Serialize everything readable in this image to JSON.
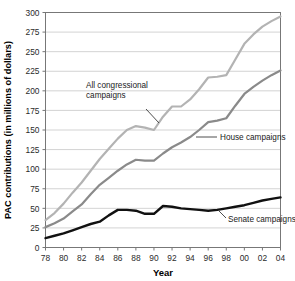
{
  "chart_data": {
    "type": "line",
    "title": "",
    "xlabel": "Year",
    "ylabel": "PAC contributions (in millions of dollars)",
    "xlim": [
      78,
      104
    ],
    "ylim": [
      0,
      300
    ],
    "ytick_step": 25,
    "grid": true,
    "legend_position": "inline-annotations",
    "categories": [
      "78",
      "80",
      "82",
      "84",
      "86",
      "88",
      "90",
      "92",
      "94",
      "96",
      "98",
      "00",
      "02",
      "04"
    ],
    "x": [
      1978,
      1980,
      1982,
      1984,
      1986,
      1988,
      1990,
      1992,
      1994,
      1996,
      1998,
      2000,
      2002,
      2004
    ],
    "xtick_labels": [
      "78",
      "80",
      "82",
      "84",
      "86",
      "88",
      "90",
      "92",
      "94",
      "96",
      "98",
      "00",
      "02",
      "04"
    ],
    "ytick_labels": [
      "0",
      "25",
      "50",
      "75",
      "100",
      "125",
      "150",
      "175",
      "200",
      "225",
      "250",
      "275",
      "300"
    ],
    "ytick_values": [
      0,
      25,
      50,
      75,
      100,
      125,
      150,
      175,
      200,
      225,
      250,
      275,
      300
    ],
    "series": [
      {
        "name": "All congressional campaigns",
        "color": "#b3b3b3",
        "label_position": "upper-left",
        "values": [
          35,
          56,
          83,
          113,
          139,
          155,
          150,
          180,
          189,
          217,
          220,
          260,
          282,
          295
        ],
        "points": [
          {
            "x": 1978,
            "y": 35
          },
          {
            "x": 1979,
            "y": 44
          },
          {
            "x": 1980,
            "y": 56
          },
          {
            "x": 1981,
            "y": 70
          },
          {
            "x": 1982,
            "y": 83
          },
          {
            "x": 1983,
            "y": 98
          },
          {
            "x": 1984,
            "y": 113
          },
          {
            "x": 1985,
            "y": 126
          },
          {
            "x": 1986,
            "y": 139
          },
          {
            "x": 1987,
            "y": 150
          },
          {
            "x": 1988,
            "y": 155
          },
          {
            "x": 1989,
            "y": 153
          },
          {
            "x": 1990,
            "y": 150
          },
          {
            "x": 1991,
            "y": 167
          },
          {
            "x": 1992,
            "y": 180
          },
          {
            "x": 1993,
            "y": 180
          },
          {
            "x": 1994,
            "y": 189
          },
          {
            "x": 1995,
            "y": 202
          },
          {
            "x": 1996,
            "y": 217
          },
          {
            "x": 1997,
            "y": 218
          },
          {
            "x": 1998,
            "y": 220
          },
          {
            "x": 1999,
            "y": 240
          },
          {
            "x": 2000,
            "y": 260
          },
          {
            "x": 2001,
            "y": 272
          },
          {
            "x": 2002,
            "y": 282
          },
          {
            "x": 2003,
            "y": 289
          },
          {
            "x": 2004,
            "y": 295
          }
        ]
      },
      {
        "name": "House campaigns",
        "color": "#8a8a8a",
        "label_position": "right-middle",
        "values": [
          26,
          37,
          55,
          80,
          98,
          112,
          111,
          128,
          141,
          160,
          165,
          196,
          213,
          226
        ],
        "points": [
          {
            "x": 1978,
            "y": 26
          },
          {
            "x": 1979,
            "y": 31
          },
          {
            "x": 1980,
            "y": 37
          },
          {
            "x": 1981,
            "y": 46
          },
          {
            "x": 1982,
            "y": 55
          },
          {
            "x": 1983,
            "y": 68
          },
          {
            "x": 1984,
            "y": 80
          },
          {
            "x": 1985,
            "y": 89
          },
          {
            "x": 1986,
            "y": 98
          },
          {
            "x": 1987,
            "y": 106
          },
          {
            "x": 1988,
            "y": 112
          },
          {
            "x": 1989,
            "y": 111
          },
          {
            "x": 1990,
            "y": 111
          },
          {
            "x": 1991,
            "y": 120
          },
          {
            "x": 1992,
            "y": 128
          },
          {
            "x": 1993,
            "y": 134
          },
          {
            "x": 1994,
            "y": 141
          },
          {
            "x": 1995,
            "y": 150
          },
          {
            "x": 1996,
            "y": 160
          },
          {
            "x": 1997,
            "y": 162
          },
          {
            "x": 1998,
            "y": 165
          },
          {
            "x": 1999,
            "y": 181
          },
          {
            "x": 2000,
            "y": 196
          },
          {
            "x": 2001,
            "y": 205
          },
          {
            "x": 2002,
            "y": 213
          },
          {
            "x": 2003,
            "y": 220
          },
          {
            "x": 2004,
            "y": 226
          }
        ]
      },
      {
        "name": "Senate campaigns",
        "color": "#111111",
        "label_position": "lower-right",
        "values": [
          12,
          18,
          26,
          36,
          48,
          47,
          43,
          52,
          49,
          47,
          50,
          54,
          60,
          64
        ],
        "points": [
          {
            "x": 1978,
            "y": 12
          },
          {
            "x": 1979,
            "y": 15
          },
          {
            "x": 1980,
            "y": 18
          },
          {
            "x": 1981,
            "y": 22
          },
          {
            "x": 1982,
            "y": 26
          },
          {
            "x": 1983,
            "y": 30
          },
          {
            "x": 1984,
            "y": 33
          },
          {
            "x": 1985,
            "y": 41
          },
          {
            "x": 1986,
            "y": 48
          },
          {
            "x": 1987,
            "y": 48
          },
          {
            "x": 1988,
            "y": 47
          },
          {
            "x": 1989,
            "y": 43
          },
          {
            "x": 1990,
            "y": 43
          },
          {
            "x": 1991,
            "y": 53
          },
          {
            "x": 1992,
            "y": 52
          },
          {
            "x": 1993,
            "y": 50
          },
          {
            "x": 1994,
            "y": 49
          },
          {
            "x": 1995,
            "y": 48
          },
          {
            "x": 1996,
            "y": 47
          },
          {
            "x": 1997,
            "y": 48
          },
          {
            "x": 1998,
            "y": 50
          },
          {
            "x": 1999,
            "y": 52
          },
          {
            "x": 2000,
            "y": 54
          },
          {
            "x": 2001,
            "y": 57
          },
          {
            "x": 2002,
            "y": 60
          },
          {
            "x": 2003,
            "y": 62
          },
          {
            "x": 2004,
            "y": 64
          }
        ]
      }
    ],
    "annotations": [
      {
        "text_line1": "All congressional",
        "text_line2": "campaigns",
        "series": "All congressional campaigns"
      },
      {
        "text_line1": "House campaigns",
        "text_line2": "",
        "series": "House campaigns"
      },
      {
        "text_line1": "Senate campaigns",
        "text_line2": "",
        "series": "Senate campaigns"
      }
    ],
    "colors": {
      "grid": "#c8c8c8",
      "axis": "#555555",
      "background": "#ffffff",
      "all_congressional": "#b3b3b3",
      "house": "#8a8a8a",
      "senate": "#111111"
    }
  }
}
